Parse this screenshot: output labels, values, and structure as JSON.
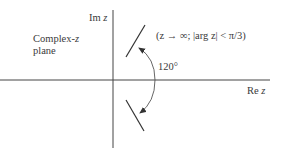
{
  "diagram": {
    "title_line1": "Complex-",
    "title_var": "z",
    "title_line2": "plane",
    "im_axis_label": "Im",
    "im_axis_var": "z",
    "re_axis_label": "Re",
    "re_axis_var": "z",
    "condition": "(z → ∞; |arg z| < π/3)",
    "angle_label": "120°",
    "colors": {
      "line": "#333333",
      "background": "#ffffff"
    }
  }
}
